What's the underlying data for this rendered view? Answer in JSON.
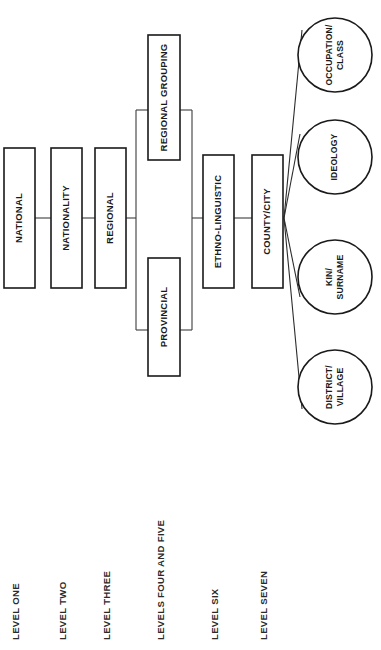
{
  "diagram": {
    "colors": {
      "background": "#ffffff",
      "stroke": "#1a1a1a",
      "connector": "#3c3c3c",
      "text": "#1a1a1a"
    },
    "boxes": [
      {
        "id": "national",
        "label": "NATIONAL",
        "x": 4,
        "y": 148,
        "w": 31,
        "h": 140
      },
      {
        "id": "nationality",
        "label": "NATIONALITY",
        "x": 51,
        "y": 148,
        "w": 31,
        "h": 140
      },
      {
        "id": "regional",
        "label": "REGIONAL",
        "x": 95,
        "y": 148,
        "w": 31,
        "h": 140
      },
      {
        "id": "regional-group",
        "label": "REGIONAL GROUPING",
        "x": 148,
        "y": 35,
        "w": 32,
        "h": 125
      },
      {
        "id": "provincial",
        "label": "PROVINCIAL",
        "x": 148,
        "y": 258,
        "w": 32,
        "h": 118
      },
      {
        "id": "ethno-linguistic",
        "label": "ETHNO-LINGUISTIC",
        "x": 203,
        "y": 155,
        "w": 31,
        "h": 133
      },
      {
        "id": "county-city",
        "label": "COUNTY/CITY",
        "x": 252,
        "y": 155,
        "w": 31,
        "h": 133
      }
    ],
    "circles": [
      {
        "id": "occupation-class",
        "lines": [
          "OCCUPATION/",
          "CLASS"
        ],
        "cx": 335,
        "cy": 55,
        "r": 37
      },
      {
        "id": "ideology",
        "lines": [
          "IDEOLOGY"
        ],
        "cx": 335,
        "cy": 157,
        "r": 37
      },
      {
        "id": "kin-surname",
        "lines": [
          "KIN/",
          "SURNAME"
        ],
        "cx": 335,
        "cy": 277,
        "r": 37
      },
      {
        "id": "district-village",
        "lines": [
          "DISTRICT/",
          "VILLAGE"
        ],
        "cx": 335,
        "cy": 387,
        "r": 37
      }
    ],
    "level_labels": [
      {
        "id": "level-one",
        "label": "LEVEL ONE",
        "x": 19
      },
      {
        "id": "level-two",
        "label": "LEVEL TWO",
        "x": 66
      },
      {
        "id": "level-three",
        "label": "LEVEL THREE",
        "x": 110
      },
      {
        "id": "levels-four-and-five",
        "label": "LEVELS FOUR AND FIVE",
        "x": 164
      },
      {
        "id": "level-six",
        "label": "LEVEL SIX",
        "x": 218
      },
      {
        "id": "level-seven",
        "label": "LEVEL SEVEN",
        "x": 267
      }
    ]
  }
}
